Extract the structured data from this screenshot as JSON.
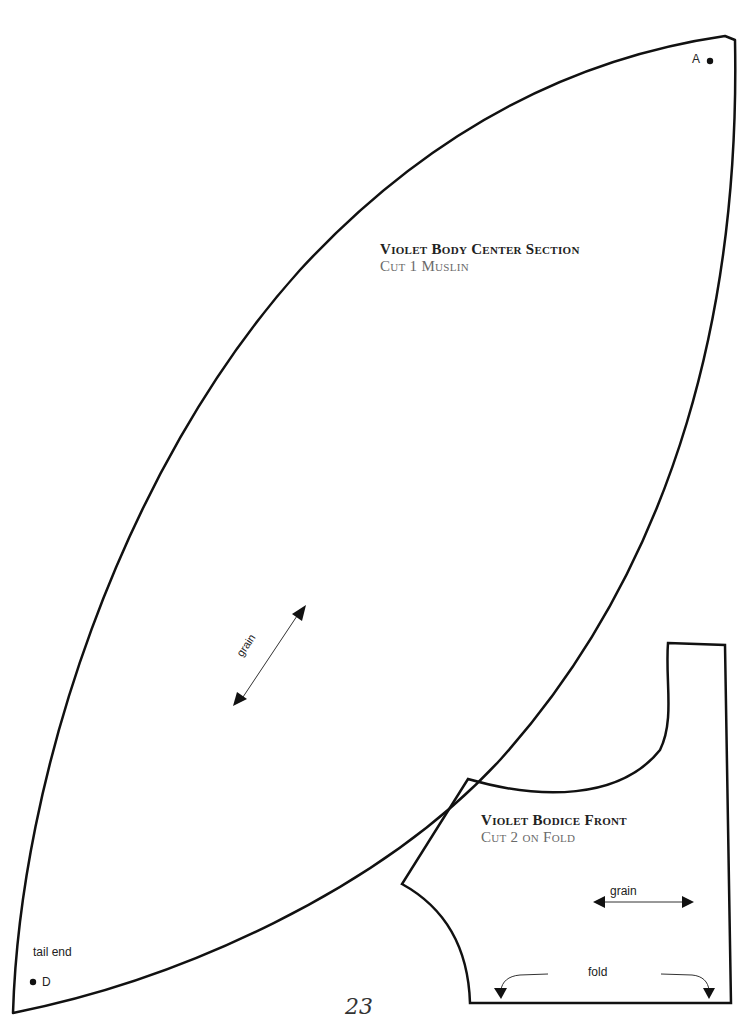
{
  "page": {
    "number": "23"
  },
  "pieces": [
    {
      "name": "body-center-section",
      "title": "Violet Body Center Section",
      "cut": "Cut 1 Muslin",
      "marks": {
        "point_a": "A",
        "point_d": "D",
        "tail": "tail end"
      },
      "grain_label": "grain"
    },
    {
      "name": "bodice-front",
      "title": "Violet Bodice Front",
      "cut": "Cut 2 on Fold",
      "grain_label": "grain",
      "fold_label": "fold"
    }
  ],
  "colors": {
    "line": "#111111",
    "title": "#222222",
    "subtitle": "#6a6a6a"
  }
}
